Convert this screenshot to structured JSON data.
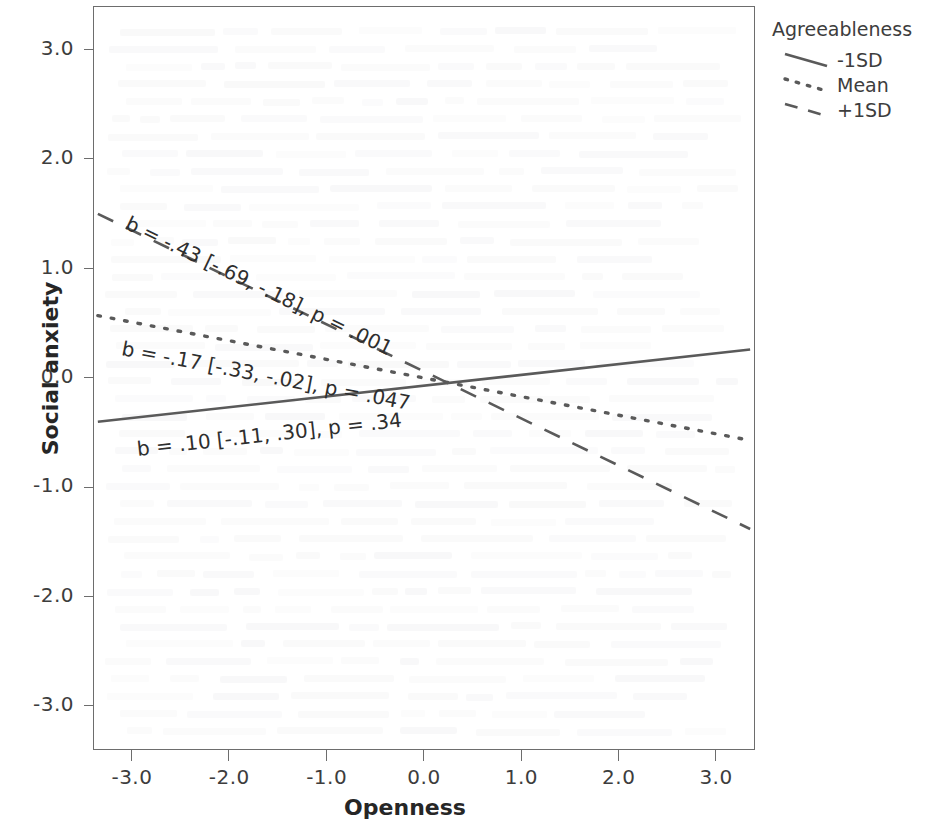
{
  "chart_data": {
    "type": "line",
    "title": "",
    "xlabel": "Openness",
    "ylabel": "Social anxiety",
    "xlim": [
      -3.4,
      3.4
    ],
    "ylim": [
      -3.4,
      3.4
    ],
    "xticks": [
      "-3.0",
      "-2.0",
      "-1.0",
      "0.0",
      "1.0",
      "2.0",
      "3.0"
    ],
    "xtick_values": [
      -3.0,
      -2.0,
      -1.0,
      0.0,
      1.0,
      2.0,
      3.0
    ],
    "yticks": [
      "3.0",
      "2.0",
      "1.0",
      "0.0",
      "-1.0",
      "-2.0",
      "-3.0"
    ],
    "ytick_values": [
      3.0,
      2.0,
      1.0,
      0.0,
      -1.0,
      -2.0,
      -3.0
    ],
    "grid": false,
    "legend_position": "top-right",
    "legend_title": "Agreeableness",
    "series": [
      {
        "name": "-1SD",
        "style": "solid",
        "slope": 0.1,
        "intercept": -0.07,
        "x": [
          -3.35,
          3.35
        ],
        "y": [
          -0.4,
          0.26
        ]
      },
      {
        "name": "Mean",
        "style": "dotted",
        "slope": -0.17,
        "intercept": 0.0,
        "x": [
          -3.35,
          3.35
        ],
        "y": [
          0.57,
          -0.57
        ]
      },
      {
        "name": "+1SD",
        "style": "dashed",
        "slope": -0.43,
        "intercept": 0.06,
        "x": [
          -3.35,
          3.35
        ],
        "y": [
          1.5,
          -1.38
        ]
      }
    ],
    "annotations": [
      {
        "id": "plus1sd",
        "text": "b = -.43 [-.69, -.18], p = .001",
        "b": "-.43",
        "ci": "[-.69, -.18]",
        "p": ".001",
        "series": "+1SD"
      },
      {
        "id": "mean",
        "text": "b = -.17 [-.33, -.02], p = .047",
        "b": "-.17",
        "ci": "[-.33, -.02]",
        "p": ".047",
        "series": "Mean"
      },
      {
        "id": "minus1sd",
        "text": "b = .10 [-.11, .30], p = .34",
        "b": ".10",
        "ci": "[-.11, .30]",
        "p": ".34",
        "series": "-1SD"
      }
    ]
  },
  "legend": {
    "title": "Agreeableness",
    "items": [
      {
        "label": "-1SD",
        "style": "solid"
      },
      {
        "label": "Mean",
        "style": "dotted"
      },
      {
        "label": "+1SD",
        "style": "dashed"
      }
    ]
  },
  "axes": {
    "x_title": "Openness",
    "y_title": "Social anxiety",
    "x_tick_labels": [
      "-3.0",
      "-2.0",
      "-1.0",
      "0.0",
      "1.0",
      "2.0",
      "3.0"
    ],
    "y_tick_labels": [
      "3.0",
      "2.0",
      "1.0",
      "0.0",
      "-1.0",
      "-2.0",
      "-3.0"
    ]
  },
  "annotation_text": {
    "plus1sd": "b = -.43 [-.69, -.18], p = .001",
    "mean": "b = -.17 [-.33, -.02], p = .047",
    "minus1sd": "b = .10 [-.11, .30], p = .34"
  },
  "colors": {
    "line": "#5a5a5a",
    "frame": "#6d6d6d",
    "text": "#3d3d3d",
    "background": "#ffffff"
  }
}
